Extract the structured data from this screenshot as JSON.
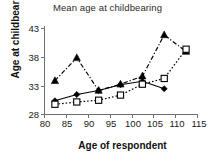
{
  "chart_data": {
    "type": "line",
    "title": "Mean age at childbearing",
    "xlabel": "Age of respondent",
    "ylabel": "Age at childbearing",
    "x": [
      82.5,
      87.5,
      92.5,
      97.5,
      102.5,
      107.5,
      112.5
    ],
    "xticks": [
      80,
      85,
      90,
      95,
      100,
      105,
      110,
      115
    ],
    "yticks": [
      28,
      33,
      38,
      43
    ],
    "xlim": [
      80,
      115
    ],
    "ylim": [
      28,
      43
    ],
    "grid": false,
    "legend": "none",
    "series": [
      {
        "name": "series-diamond",
        "marker": "diamond",
        "line_style": "solid",
        "color": "#000000",
        "values": [
          30.3,
          31.4,
          32.1,
          33.1,
          33.7,
          32.4,
          null
        ]
      },
      {
        "name": "series-triangle",
        "marker": "triangle",
        "line_style": "dash-dot",
        "color": "#000000",
        "values": [
          33.8,
          37.8,
          32.1,
          33.2,
          34.6,
          41.8,
          38.9
        ]
      },
      {
        "name": "series-square",
        "marker": "square-open",
        "line_style": "dotted",
        "color": "#000000",
        "values": [
          29.7,
          30.1,
          30.4,
          31.3,
          33.2,
          34.2,
          39.3
        ]
      }
    ]
  },
  "axis": {
    "ytick_labels": [
      "43",
      "38",
      "33",
      "28"
    ],
    "xtick_labels": [
      "80",
      "85",
      "90",
      "95",
      "100",
      "105",
      "110",
      "115"
    ]
  }
}
